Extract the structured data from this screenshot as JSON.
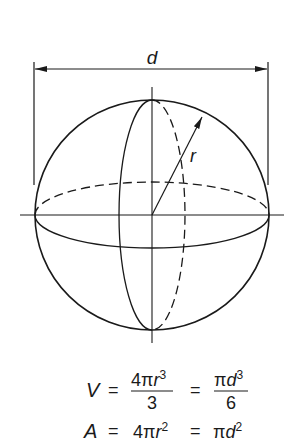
{
  "diagram": {
    "labels": {
      "diameter": "d",
      "radius": "r"
    },
    "colors": {
      "ink": "#1a1a1a",
      "background": "#ffffff"
    }
  },
  "formulas": {
    "volume": {
      "lhs": "V",
      "eq1": "=",
      "frac1_num_coef": "4π",
      "frac1_num_var": "r",
      "frac1_num_exp": "3",
      "frac1_den": "3",
      "eq2": "=",
      "frac2_num_coef": "π",
      "frac2_num_var": "d",
      "frac2_num_exp": "3",
      "frac2_den": "6"
    },
    "area": {
      "lhs": "A",
      "eq1": "=",
      "term1_coef": "4π",
      "term1_var": "r",
      "term1_exp": "2",
      "eq2": "=",
      "term2_coef": "π",
      "term2_var": "d",
      "term2_exp": "2"
    }
  }
}
